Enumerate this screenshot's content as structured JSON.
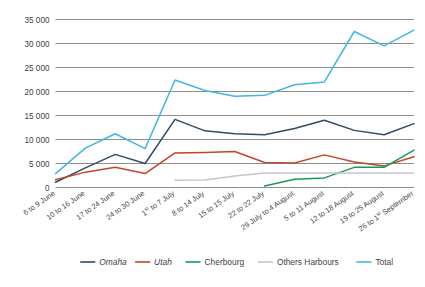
{
  "chart_data": {
    "type": "line",
    "title": "",
    "xlabel": "",
    "ylabel": "",
    "ylim": [
      0,
      35000
    ],
    "ytick_step": 5000,
    "grid": true,
    "legend_position": "bottom",
    "ytick_labels": [
      "35 000",
      "30 000",
      "25 000",
      "20 000",
      "15 000",
      "10 000",
      "5 000",
      "0"
    ],
    "ytick_values": [
      35000,
      30000,
      25000,
      20000,
      15000,
      10000,
      5000,
      0
    ],
    "categories": [
      "6 to 9 June",
      "10 to 16 June",
      "17 to 24 June",
      "24 to 30 June",
      "1st to 7 July",
      "8 to 14 July",
      "15 to 15 July",
      "22 to 22 July",
      "29 July to 4 August",
      "5 to 11 August",
      "12 to 18 August",
      "19 to 25 August",
      "26 to 1st September"
    ],
    "series": [
      {
        "name": "Omaha",
        "color": "#2E4B68",
        "italic": true,
        "values": [
          1100,
          4100,
          6900,
          5000,
          14200,
          11800,
          11200,
          11000,
          12300,
          14000,
          11900,
          11000,
          13300
        ]
      },
      {
        "name": "Utah",
        "color": "#C0462A",
        "italic": true,
        "values": [
          1600,
          3200,
          4200,
          2900,
          7200,
          7300,
          7500,
          5200,
          5100,
          6800,
          5300,
          4500,
          6400
        ]
      },
      {
        "name": "Cherbourg",
        "color": "#179B57",
        "italic": false,
        "values": [
          null,
          null,
          null,
          null,
          null,
          null,
          null,
          300,
          1700,
          2000,
          4200,
          4200,
          7800
        ]
      },
      {
        "name": "Others Harbours",
        "color": "#C8C3D2",
        "italic": false,
        "values": [
          null,
          null,
          null,
          null,
          1500,
          1550,
          2400,
          3000,
          3000,
          3000,
          3000,
          3000,
          3000
        ]
      },
      {
        "name": "Total",
        "color": "#3FB6E3",
        "italic": false,
        "values": [
          2900,
          8200,
          11200,
          8100,
          22400,
          20200,
          19000,
          19200,
          21400,
          22000,
          32500,
          29500,
          32800
        ]
      }
    ]
  },
  "legend": {
    "items": [
      {
        "label": "Omaha"
      },
      {
        "label": "Utah"
      },
      {
        "label": "Cherbourg"
      },
      {
        "label": "Others Harbours"
      },
      {
        "label": "Total"
      }
    ]
  }
}
